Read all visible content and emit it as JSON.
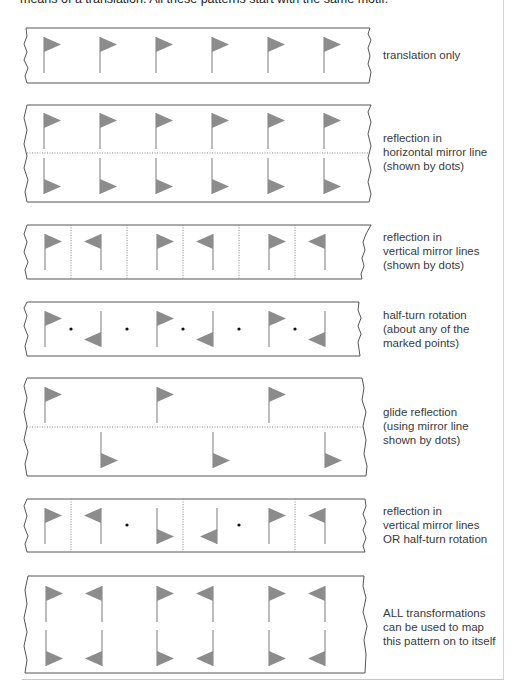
{
  "intro_text": "means of a translation. All these patterns start with the same motif.",
  "colors": {
    "flag": "#8c8c8c",
    "border": "#555555",
    "dots": "#777777",
    "text": "#3a3a3a"
  },
  "strips": [
    {
      "id": "translation",
      "label_lines": [
        "translation only"
      ]
    },
    {
      "id": "horizontal-reflection",
      "label_lines": [
        "reflection in",
        "horizontal mirror line",
        "(shown by dots)"
      ]
    },
    {
      "id": "vertical-reflection",
      "label_lines": [
        "reflection in",
        "vertical mirror lines",
        "(shown by dots)"
      ]
    },
    {
      "id": "half-turn",
      "label_lines": [
        "half-turn rotation",
        "(about any of the",
        "marked points)"
      ]
    },
    {
      "id": "glide-reflection",
      "label_lines": [
        "glide reflection",
        "(using mirror line",
        "shown by dots)"
      ]
    },
    {
      "id": "vertical-or-half-turn",
      "label_lines": [
        "reflection in",
        "vertical mirror lines",
        "OR half-turn rotation"
      ]
    },
    {
      "id": "all-transformations",
      "label_lines": [
        "ALL transformations",
        "can be used to map",
        "this pattern on to itself"
      ]
    }
  ]
}
